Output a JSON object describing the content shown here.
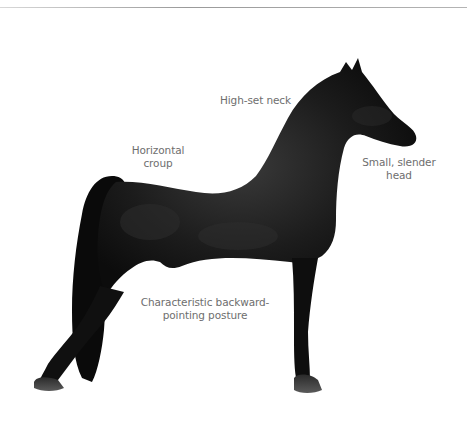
{
  "figure": {
    "colors": {
      "background": "#ffffff",
      "horse_body": "#111111",
      "horse_highlight": "#3a3a3a",
      "hoof": "#4a4a4a",
      "label_text": "#6e6e6e",
      "top_rule": "#a8a8a8"
    },
    "annotations": [
      {
        "id": "neck",
        "line1": "High-set neck",
        "line2": ""
      },
      {
        "id": "croup",
        "line1": "Horizontal",
        "line2": "croup"
      },
      {
        "id": "head",
        "line1": "Small, slender",
        "line2": "head"
      },
      {
        "id": "posture",
        "line1": "Characteristic backward-",
        "line2": "pointing posture"
      }
    ]
  }
}
